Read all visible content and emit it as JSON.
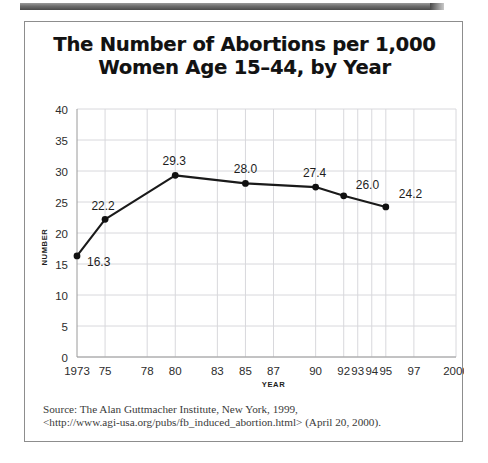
{
  "figure": {
    "title_line1": "The Number of Abortions per 1,000",
    "title_line2": "Women Age 15–44, by Year",
    "source_line1": "Source: The Alan Guttmacher Institute, New York, 1999,",
    "source_line2": "<http://www.agi-usa.org/pubs/fb_induced_abortion.html> (April 20, 2000)."
  },
  "chart_data": {
    "type": "line",
    "title": "The Number of Abortions per 1,000 Women Age 15–44, by Year",
    "xlabel": "YEAR",
    "ylabel": "NUMBER",
    "x": [
      1973,
      1975,
      1980,
      1985,
      1990,
      1992,
      1995
    ],
    "values": [
      16.3,
      22.2,
      29.3,
      28.0,
      27.4,
      26.0,
      24.2
    ],
    "point_labels": [
      "16.3",
      "22.2",
      "29.3",
      "28.0",
      "27.4",
      "26.0",
      "24.2"
    ],
    "ylim": [
      0,
      40
    ],
    "yticks": [
      0,
      5,
      10,
      15,
      20,
      25,
      30,
      35,
      40
    ],
    "ytick_labels": [
      "0",
      "5",
      "10",
      "15",
      "20",
      "25",
      "30",
      "35",
      "40"
    ],
    "xtick_values": [
      1973,
      1975,
      1978,
      1980,
      1983,
      1985,
      1987,
      1990,
      1992,
      1993,
      1994,
      1995,
      1997,
      2000
    ],
    "xtick_labels": [
      "1973",
      "75",
      "78",
      "80",
      "83",
      "85",
      "87",
      "90",
      "92",
      "93",
      "94",
      "95",
      "97",
      "2000"
    ],
    "grid": true,
    "legend": "none",
    "line_color": "#1a1a1a",
    "marker_color": "#111111",
    "grid_color": "#d8d8dc"
  }
}
